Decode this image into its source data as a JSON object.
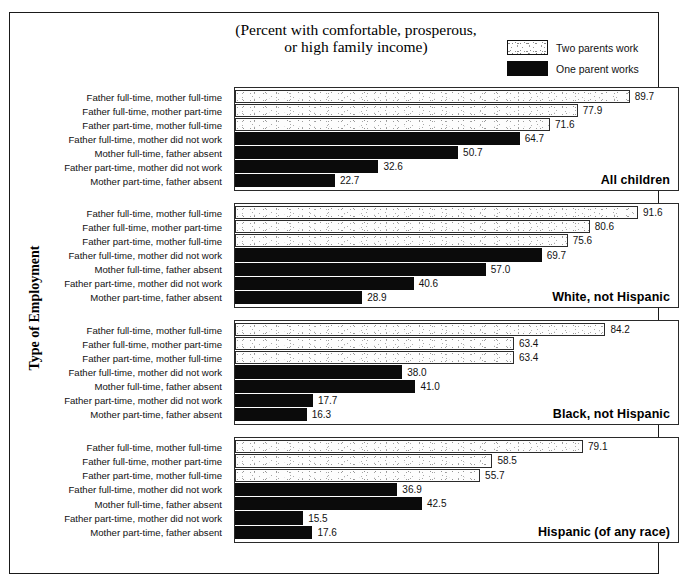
{
  "title": {
    "line1": "(Percent with comfortable, prosperous,",
    "line2": "or high family income)"
  },
  "legend": {
    "items": [
      {
        "label": "Two parents work",
        "style": "two",
        "color": "#ffffff"
      },
      {
        "label": "One parent works",
        "style": "one",
        "color": "#0b0b0b"
      }
    ]
  },
  "axis": {
    "y_title": "Type of Employment"
  },
  "categories": [
    "Father full-time, mother full-time",
    "Father full-time, mother part-time",
    "Father part-time, mother full-time",
    "Father full-time, mother did not work",
    "Mother full-time, father absent",
    "Father part-time, mother did not work",
    "Mother part-time, father absent"
  ],
  "panels": [
    {
      "title": "All children",
      "values": [
        89.7,
        77.9,
        71.6,
        64.7,
        50.7,
        32.6,
        22.7
      ],
      "labels": [
        "89.7",
        "77.9",
        "71.6",
        "64.7",
        "50.7",
        "32.6",
        "22.7"
      ]
    },
    {
      "title": "White, not Hispanic",
      "values": [
        91.6,
        80.6,
        75.6,
        69.7,
        57.0,
        40.6,
        28.9
      ],
      "labels": [
        "91.6",
        "80.6",
        "75.6",
        "69.7",
        "57.0",
        "40.6",
        "28.9"
      ]
    },
    {
      "title": "Black, not Hispanic",
      "values": [
        84.2,
        63.4,
        63.4,
        38.0,
        41.0,
        17.7,
        16.3
      ],
      "labels": [
        "84.2",
        "63.4",
        "63.4",
        "38.0",
        "41.0",
        "17.7",
        "16.3"
      ]
    },
    {
      "title": "Hispanic (of any race)",
      "values": [
        79.1,
        58.5,
        55.7,
        36.9,
        42.5,
        15.5,
        17.6
      ],
      "labels": [
        "79.1",
        "58.5",
        "55.7",
        "36.9",
        "42.5",
        "15.5",
        "17.6"
      ]
    }
  ],
  "chart_data": {
    "type": "bar",
    "orientation": "horizontal",
    "title": "(Percent with comfortable, prosperous, or high family income)",
    "xlabel": "",
    "ylabel": "Type of Employment",
    "xlim": [
      0,
      100
    ],
    "grid": false,
    "legend_position": "top-right",
    "legend": [
      "Two parents work",
      "One parent works"
    ],
    "categories": [
      "Father full-time, mother full-time",
      "Father full-time, mother part-time",
      "Father part-time, mother full-time",
      "Father full-time, mother did not work",
      "Mother full-time, father absent",
      "Father part-time, mother did not work",
      "Mother part-time, father absent"
    ],
    "category_group": [
      "Two parents work",
      "Two parents work",
      "Two parents work",
      "One parent works",
      "One parent works",
      "One parent works",
      "One parent works"
    ],
    "panels": [
      {
        "name": "All children",
        "values": [
          89.7,
          77.9,
          71.6,
          64.7,
          50.7,
          32.6,
          22.7
        ]
      },
      {
        "name": "White, not Hispanic",
        "values": [
          91.6,
          80.6,
          75.6,
          69.7,
          57.0,
          40.6,
          28.9
        ]
      },
      {
        "name": "Black, not Hispanic",
        "values": [
          84.2,
          63.4,
          63.4,
          38.0,
          41.0,
          17.7,
          16.3
        ]
      },
      {
        "name": "Hispanic (of any race)",
        "values": [
          79.1,
          58.5,
          55.7,
          36.9,
          42.5,
          15.5,
          17.6
        ]
      }
    ]
  }
}
